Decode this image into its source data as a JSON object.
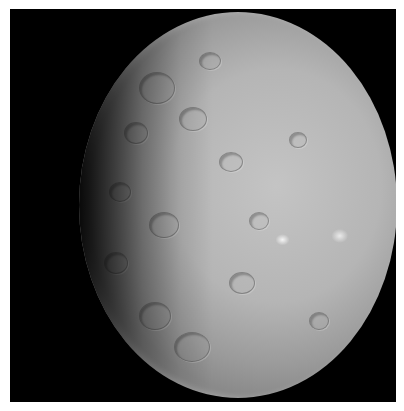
{
  "image": {
    "subject": "cratered dwarf planet, partially lit",
    "background_color": "#000000",
    "surface_color": "#b8b8b8",
    "bright_spots": [
      {
        "x_pct": 64,
        "y_pct": 59
      },
      {
        "x_pct": 82,
        "y_pct": 58
      }
    ]
  }
}
